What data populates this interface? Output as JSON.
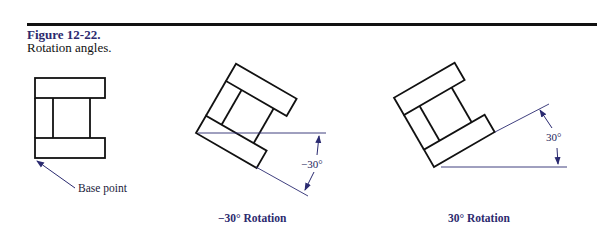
{
  "figure": {
    "number": "Figure 12-22.",
    "title": "Rotation angles."
  },
  "panels": [
    {
      "id": "original",
      "annotation": "Base point"
    },
    {
      "id": "neg30",
      "angle_label": "−30°",
      "caption": "−30° Rotation"
    },
    {
      "id": "pos30",
      "angle_label": "30°",
      "caption": "30° Rotation"
    }
  ],
  "colors": {
    "outline": "#111111",
    "dimension": "#2a2a70",
    "caption": "#2c2a6e"
  }
}
